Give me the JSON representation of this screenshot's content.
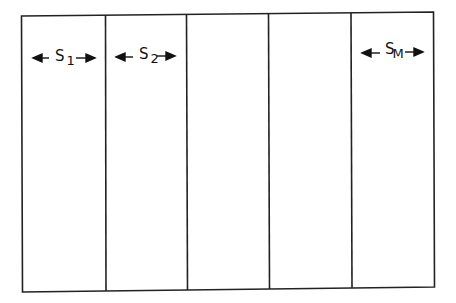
{
  "diagram": {
    "strip_count": 5,
    "labels": [
      {
        "base": "S",
        "sub": "1",
        "strip": 1
      },
      {
        "base": "S",
        "sub": "2",
        "strip": 2
      },
      {
        "base": "S",
        "sub": "M",
        "strip": 5
      }
    ],
    "line_color": "#222222"
  }
}
